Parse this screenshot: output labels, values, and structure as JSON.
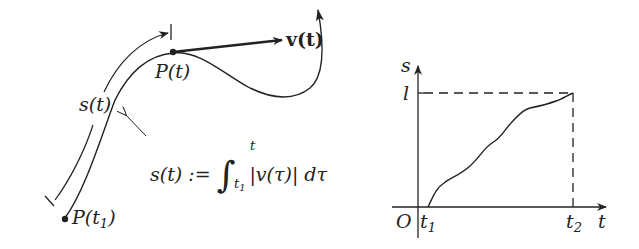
{
  "figure": {
    "left_diagram": {
      "labels": {
        "velocity": "v(t)",
        "point_t": "P(t)",
        "point_t1_prefix": "P(t",
        "point_t1_sub": "1",
        "point_t1_suffix": ")",
        "arc_length": "s(t)"
      },
      "formula": {
        "lhs": "s(t) :=",
        "integral_symbol": "∫",
        "upper_limit": "t",
        "lower_limit_base": "t",
        "lower_limit_sub": "1",
        "integrand": "|v(τ)| dτ"
      }
    },
    "right_graph": {
      "y_axis_label": "s",
      "x_axis_label": "t",
      "origin_label": "O",
      "y_level_label": "l",
      "x_tick_t1_base": "t",
      "x_tick_t1_sub": "1",
      "x_tick_t2_base": "t",
      "x_tick_t2_sub": "2"
    },
    "colors": {
      "ink": "#222222",
      "background": "#ffffff"
    }
  }
}
